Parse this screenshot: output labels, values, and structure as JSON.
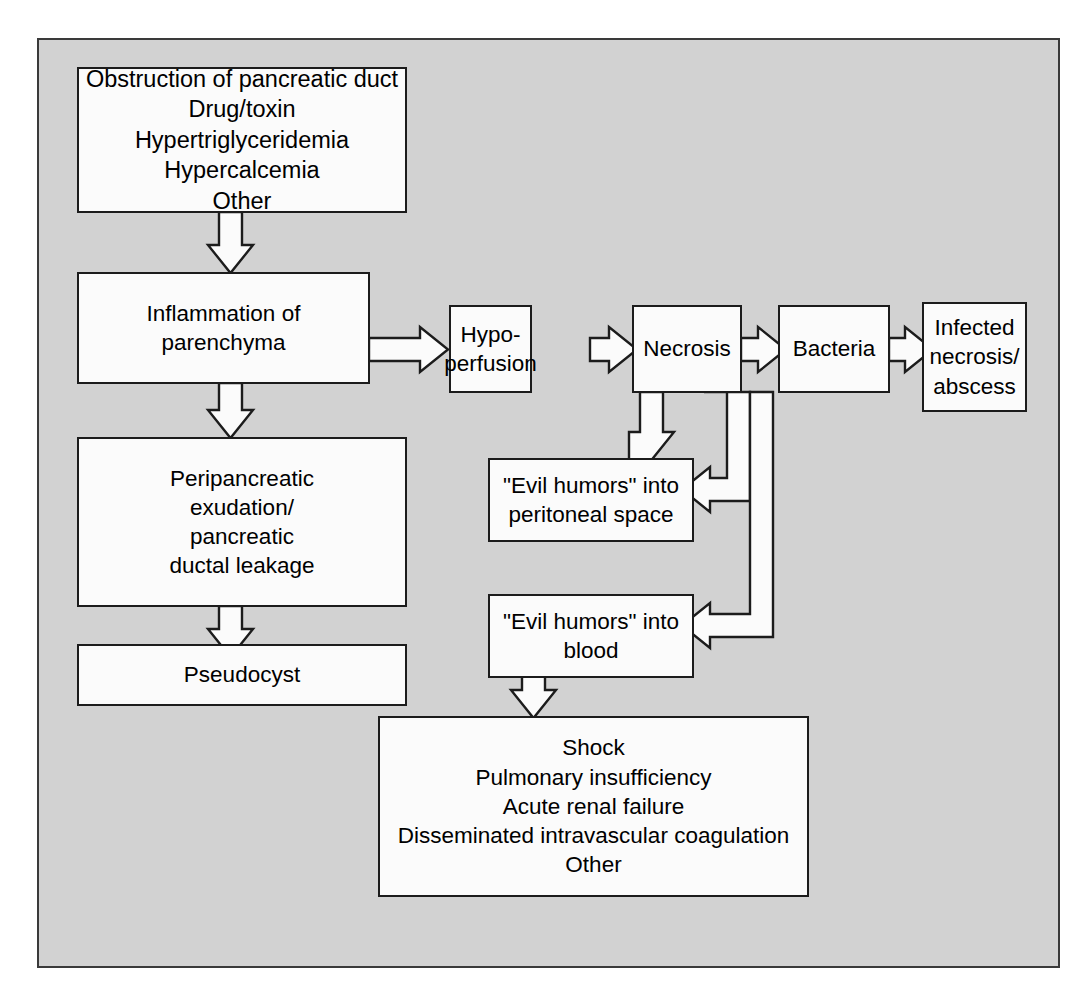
{
  "diagram": {
    "background_color": "#d2d2d2",
    "box_fill_color": "#fbfbfb",
    "line_color": "#1c1c1c",
    "nodes": {
      "etiologies": "Obstruction of pancreatic duct\nDrug/toxin\nHypertriglyceridemia\nHypercalcemia\nOther",
      "inflammation": "Inflammation of\nparenchyma",
      "hypoperfusion": "Hypo-\nperfusion",
      "necrosis": "Necrosis",
      "bacteria": "Bacteria",
      "infected_necrosis": "Infected\nnecrosis/\nabscess",
      "peripancreatic_exudation": "Peripancreatic\nexudation/\npancreatic\nductal leakage",
      "pseudocyst": "Pseudocyst",
      "evil_humors_peritoneal": "\"Evil humors\" into\nperitoneal space",
      "evil_humors_blood": "\"Evil humors\" into\nblood",
      "systemic_complications": "Shock\nPulmonary insufficiency\nAcute renal failure\nDisseminated intravascular coagulation\nOther"
    },
    "edges": [
      {
        "from": "etiologies",
        "to": "inflammation",
        "direction": "down"
      },
      {
        "from": "inflammation",
        "to": "hypoperfusion",
        "direction": "right"
      },
      {
        "from": "hypoperfusion",
        "to": "necrosis",
        "direction": "right"
      },
      {
        "from": "necrosis",
        "to": "bacteria",
        "direction": "right"
      },
      {
        "from": "bacteria",
        "to": "infected_necrosis",
        "direction": "right"
      },
      {
        "from": "inflammation",
        "to": "peripancreatic_exudation",
        "direction": "down"
      },
      {
        "from": "peripancreatic_exudation",
        "to": "pseudocyst",
        "direction": "down"
      },
      {
        "from": "necrosis",
        "to": "evil_humors_peritoneal",
        "direction": "down"
      },
      {
        "from": "necrosis",
        "to": "evil_humors_peritoneal",
        "direction": "elbow-right-down-left"
      },
      {
        "from": "necrosis",
        "to": "evil_humors_blood",
        "direction": "elbow-right-down-left"
      },
      {
        "from": "evil_humors_blood",
        "to": "systemic_complications",
        "direction": "down"
      }
    ]
  }
}
